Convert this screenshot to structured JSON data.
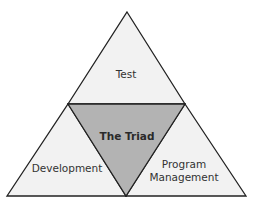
{
  "diagram": {
    "title": "The Triad",
    "segments": {
      "top": {
        "label": "Test"
      },
      "left": {
        "label": "Development"
      },
      "right": {
        "label_line1": "Program",
        "label_line2": "Management"
      },
      "center": {
        "label": "The Triad"
      }
    },
    "colors": {
      "outer_fill": "#f2f2f2",
      "center_fill": "#b3b3b3",
      "stroke": "#222222"
    }
  }
}
